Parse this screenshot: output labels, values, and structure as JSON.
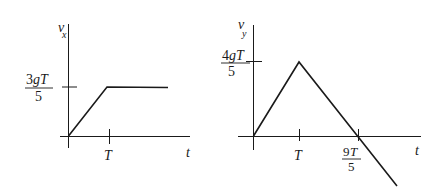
{
  "figures": [
    {
      "name": "vx-vs-t",
      "y_axis_label": {
        "main": "v",
        "sub": "x"
      },
      "x_axis_label": "t",
      "y_tick": {
        "numerator_num": "3",
        "numerator_var": "gT",
        "denominator": "5"
      },
      "x_ticks": [
        {
          "label": "T"
        }
      ],
      "description": "v_x rises linearly from 0 to 3gT/5 at t=T, then stays constant"
    },
    {
      "name": "vy-vs-t",
      "y_axis_label": {
        "main": "v",
        "sub": "y"
      },
      "x_axis_label": "t",
      "y_tick": {
        "numerator_num": "4",
        "numerator_var": "gT",
        "denominator": "5"
      },
      "x_ticks": [
        {
          "label": "T"
        },
        {
          "numerator_num": "9",
          "numerator_var": "T",
          "denominator": "5"
        }
      ],
      "description": "v_y rises linearly from 0 to 4gT/5 at t=T, then decreases linearly, crossing zero at t=9T/5 and continuing negative"
    }
  ],
  "stroke_color": "#1a1a1a"
}
